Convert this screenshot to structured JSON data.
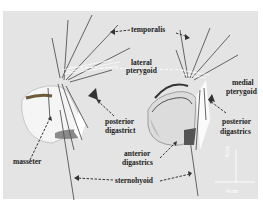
{
  "figure": {
    "type": "anatomical 3D musculoskeletal model of jaw (two views)",
    "background_color": "#e4e4e4",
    "labels": {
      "temporalis": "temporalis",
      "lateral_pterygoid_1": "lateral",
      "lateral_pterygoid_2": "pterygoid",
      "medial_pterygoid_1": "medial",
      "medial_pterygoid_2": "pterygoid",
      "posterior_digastric_left_1": "posterior",
      "posterior_digastric_left_2": "digastrict",
      "posterior_digastric_right_1": "posterior",
      "posterior_digastric_right_2": "digastrics",
      "masseter": "masseter",
      "anterior_digastrics_1": "anterior",
      "anterior_digastrics_2": "digastrics",
      "sternohyoid": "sternohyoid"
    },
    "scale_bar": {
      "vertical_label": "4cm",
      "horizontal_label": "4cm",
      "color": "#ffffff"
    }
  }
}
